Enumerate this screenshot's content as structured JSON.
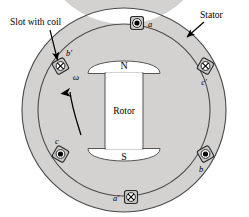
{
  "figure": {
    "background_color": "#ffffff",
    "stator_fill": "#d4d2d0",
    "stator_stroke": "#4a4a4a",
    "rotor_fill": "#ffffff",
    "rotor_stroke": "#555555",
    "slot_fill": "#c9c7c5",
    "slot_stroke": "#2a2a2a",
    "text_color": "#000000"
  },
  "annotations": {
    "slot_with_coil": "Slot with coil",
    "stator": "Stator"
  },
  "rotor": {
    "body_label": "Rotor",
    "north_pole": "N",
    "south_pole": "S",
    "rotation_symbol": "ω",
    "rotation_direction": "counterclockwise"
  },
  "slots": [
    {
      "id": "a",
      "label": "a",
      "angle_deg": 90,
      "current": "out-of-page",
      "marker": "dot",
      "label_dx": 13,
      "label_dy": 4
    },
    {
      "id": "c'",
      "label": "c′",
      "angle_deg": 30,
      "current": "into-page",
      "marker": "cross",
      "label_dx": -2,
      "label_dy": 17
    },
    {
      "id": "b",
      "label": "b",
      "angle_deg": -30,
      "current": "out-of-page",
      "marker": "dot",
      "label_dx": -5,
      "label_dy": 17
    },
    {
      "id": "a'",
      "label": "a′",
      "angle_deg": -90,
      "current": "into-page",
      "marker": "cross",
      "label_dx": -15,
      "label_dy": 4
    },
    {
      "id": "c",
      "label": "c",
      "angle_deg": 210,
      "current": "out-of-page",
      "marker": "dot",
      "label_dx": -2,
      "label_dy": -11
    },
    {
      "id": "b'",
      "label": "b′",
      "angle_deg": 150,
      "current": "into-page",
      "marker": "cross",
      "label_dx": 8,
      "label_dy": -10
    }
  ],
  "geometry": {
    "center_x": 124,
    "center_y": 110,
    "outer_radius": 102,
    "inner_radius": 86,
    "slot_radius": 94,
    "slot_size": 13
  }
}
